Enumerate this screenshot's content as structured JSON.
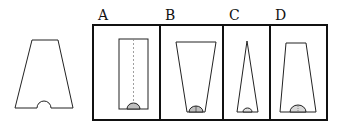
{
  "diagram": {
    "reference_shape": "trapezoid-with-semicircle-notch",
    "options": [
      {
        "label": "A",
        "shape": "rectangle-with-semicircle"
      },
      {
        "label": "B",
        "shape": "inverted-trapezoid-with-semicircle"
      },
      {
        "label": "C",
        "shape": "narrow-triangle-with-semicircle"
      },
      {
        "label": "D",
        "shape": "trapezoid-with-semicircle"
      }
    ]
  },
  "colors": {
    "stroke": "#222222",
    "frame": "#111111",
    "fill_semicircle": "#bfbfbf",
    "background": "#ffffff"
  }
}
